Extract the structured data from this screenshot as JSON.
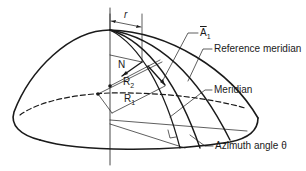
{
  "figure": {
    "labels": {
      "r": "r",
      "A1": "A",
      "A1_sub": "1",
      "N": "N",
      "R2": "R",
      "R2_sub": "2",
      "R1": "R",
      "R1_sub": "1",
      "reference_meridian": "Reference meridian",
      "meridian": "Meridian",
      "azimuth_angle": "Azimuth angle θ"
    },
    "colors": {
      "stroke": "#1a1a1a",
      "background": "#ffffff"
    }
  }
}
